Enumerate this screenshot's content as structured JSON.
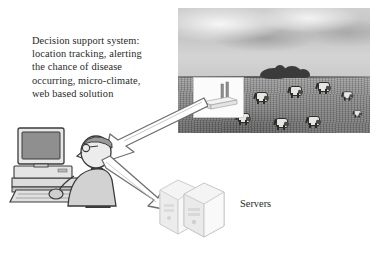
{
  "diagram": {
    "background_color": "#ffffff",
    "width": 382,
    "height": 259
  },
  "caption": {
    "lines": [
      "Decision support system:",
      "location tracking, alerting",
      "the chance of disease",
      "occurring, micro-climate,",
      "web based solution"
    ],
    "text_color": "#2a2a2a"
  },
  "photo": {
    "description": "Grayscale photograph of an open grassy field with cloudy sky",
    "sky_color": "#c8c8c8",
    "ground_color": "#838383",
    "tree_color": "#3b3b3b",
    "cattle_count": 9,
    "cattle_body_color": "#e8e6e0",
    "router_inset": {
      "device_name": "wireless-router",
      "antenna_count": 2,
      "background_color": "#fbfbfb"
    }
  },
  "workstation": {
    "description": "Person seated at a desk working on a desktop computer",
    "monitor_screen_color": "#8f8f8f",
    "outline_color": "#3a3a3a",
    "fill_color": "#d6d6d6"
  },
  "servers": {
    "label": "Servers",
    "count": 2,
    "fill_color": "#f0f0f0",
    "outline_color": "#c9c9c9",
    "label_color": "#2a2a2a"
  },
  "arrows": [
    {
      "name": "photo-to-user",
      "direction": "down-left",
      "style": "hollow-block-arrow",
      "outline_color": "#7a7a7a"
    },
    {
      "name": "user-to-servers",
      "direction": "down-right",
      "style": "hollow-block-arrow",
      "outline_color": "#7a7a7a"
    }
  ]
}
